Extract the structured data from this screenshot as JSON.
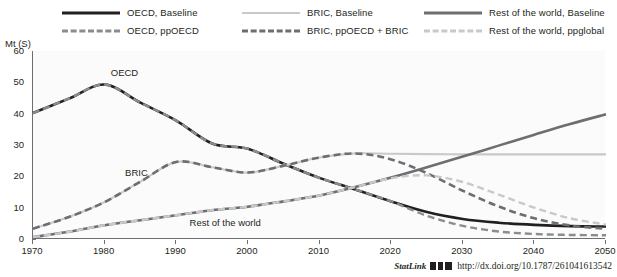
{
  "chart_data": {
    "type": "line",
    "title": "",
    "xlabel": "",
    "ylabel": "Mt (S)",
    "xlim": [
      1970,
      2050
    ],
    "ylim": [
      0,
      60
    ],
    "xticks": [
      "1970",
      "1980",
      "1990",
      "2000",
      "2010",
      "2020",
      "2030",
      "2040",
      "2050"
    ],
    "yticks": [
      "60",
      "50",
      "40",
      "30",
      "20",
      "10",
      "0"
    ],
    "grid": false,
    "legend_position": "top",
    "annotations": [
      {
        "text": "OECD",
        "x": 1981,
        "y": 53
      },
      {
        "text": "BRIC",
        "x": 1983,
        "y": 21
      },
      {
        "text": "Rest of the world",
        "x": 1992,
        "y": 5
      }
    ],
    "x": [
      1970,
      1975,
      1980,
      1985,
      1990,
      1995,
      2000,
      2005,
      2010,
      2015,
      2020,
      2025,
      2030,
      2035,
      2040,
      2045,
      2050
    ],
    "series": [
      {
        "name": "OECD, Baseline",
        "style": "solid",
        "color": "#231f20",
        "width": 2.6,
        "values": [
          40.2,
          44.8,
          49.3,
          43.5,
          37.8,
          30.5,
          28.8,
          24.0,
          19.5,
          15.8,
          12.0,
          8.6,
          6.4,
          5.2,
          4.5,
          4.1,
          4.0
        ]
      },
      {
        "name": "OECD, ppOECD",
        "style": "dashed",
        "color": "#8c8c8c",
        "width": 2.4,
        "values": [
          40.2,
          44.8,
          49.3,
          43.5,
          37.8,
          30.5,
          28.8,
          24.0,
          19.5,
          15.8,
          12.0,
          7.4,
          4.2,
          2.4,
          1.6,
          1.3,
          1.2
        ]
      },
      {
        "name": "BRIC, Baseline",
        "style": "solid",
        "color": "#c9c9c9",
        "width": 2.2,
        "values": [
          3.3,
          7.0,
          11.8,
          18.3,
          24.6,
          22.9,
          21.2,
          23.4,
          26.0,
          27.3,
          27.2,
          27.1,
          27.0,
          27.0,
          27.0,
          27.0,
          27.0
        ]
      },
      {
        "name": "BRIC, ppOECD + BRIC",
        "style": "dashed",
        "color": "#6d6e71",
        "width": 2.6,
        "values": [
          3.3,
          7.0,
          11.8,
          18.3,
          24.6,
          22.9,
          21.2,
          23.4,
          26.0,
          27.3,
          25.4,
          21.0,
          15.4,
          10.4,
          6.6,
          4.3,
          3.3
        ]
      },
      {
        "name": "Rest of the world, Baseline",
        "style": "solid",
        "color": "#6d6e71",
        "width": 2.6,
        "values": [
          0.6,
          2.3,
          4.4,
          6.0,
          7.6,
          9.2,
          10.3,
          12.0,
          13.9,
          16.6,
          19.6,
          22.9,
          26.3,
          29.8,
          33.3,
          36.7,
          39.8
        ]
      },
      {
        "name": "Rest of the world, ppglobal",
        "style": "dashed",
        "color": "#c9c9c9",
        "width": 2.4,
        "values": [
          0.6,
          2.3,
          4.4,
          6.0,
          7.6,
          9.2,
          10.3,
          12.0,
          13.9,
          16.6,
          19.4,
          20.3,
          18.2,
          14.2,
          10.0,
          6.6,
          4.6
        ]
      }
    ]
  },
  "legend": {
    "columns": [
      {
        "items": [
          {
            "label": "OECD, Baseline",
            "style": "solid",
            "color": "#231f20",
            "width": 3
          },
          {
            "label": "OECD, ppOECD",
            "style": "dashed",
            "color": "#8c8c8c",
            "width": 3
          }
        ]
      },
      {
        "items": [
          {
            "label": "BRIC, Baseline",
            "style": "solid",
            "color": "#c9c9c9",
            "width": 2
          },
          {
            "label": "BRIC, ppOECD + BRIC",
            "style": "dashed",
            "color": "#6d6e71",
            "width": 3
          }
        ]
      },
      {
        "items": [
          {
            "label": "Rest of the world, Baseline",
            "style": "solid",
            "color": "#6d6e71",
            "width": 3
          },
          {
            "label": "Rest of the world, ppglobal",
            "style": "dashed",
            "color": "#c9c9c9",
            "width": 3
          }
        ]
      }
    ]
  },
  "footer": {
    "statlink_label": "StatLink",
    "doi_url": "http://dx.doi.org/10.1787/261041613542"
  }
}
